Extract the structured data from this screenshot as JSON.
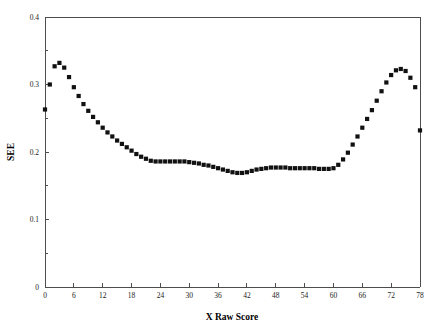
{
  "chart_data": {
    "type": "scatter",
    "title": "",
    "xlabel": "X Raw Score",
    "ylabel": "SEE",
    "xlim": [
      0,
      78
    ],
    "ylim": [
      0,
      0.4
    ],
    "xticks": [
      0,
      6,
      12,
      18,
      24,
      30,
      36,
      42,
      48,
      54,
      60,
      66,
      72,
      78
    ],
    "yticks": [
      0,
      0.1,
      0.2,
      0.3,
      0.4
    ],
    "xtick_labels": [
      "0",
      "6",
      "12",
      "18",
      "24",
      "30",
      "36",
      "42",
      "48",
      "54",
      "60",
      "66",
      "72",
      "78"
    ],
    "ytick_labels": [
      "0",
      "0.1",
      "0.2",
      "0.3",
      "0.4"
    ],
    "grid": false,
    "legend": null,
    "marker": "square",
    "marker_color": "#111111",
    "marker_size": 2.1,
    "x": [
      0,
      1,
      2,
      3,
      4,
      5,
      6,
      7,
      8,
      9,
      10,
      11,
      12,
      13,
      14,
      15,
      16,
      17,
      18,
      19,
      20,
      21,
      22,
      23,
      24,
      25,
      26,
      27,
      28,
      29,
      30,
      31,
      32,
      33,
      34,
      35,
      36,
      37,
      38,
      39,
      40,
      41,
      42,
      43,
      44,
      45,
      46,
      47,
      48,
      49,
      50,
      51,
      52,
      53,
      54,
      55,
      56,
      57,
      58,
      59,
      60,
      61,
      62,
      63,
      64,
      65,
      66,
      67,
      68,
      69,
      70,
      71,
      72,
      73,
      74,
      75,
      76,
      77,
      78
    ],
    "values": [
      0.263,
      0.3,
      0.327,
      0.332,
      0.325,
      0.311,
      0.296,
      0.283,
      0.271,
      0.261,
      0.252,
      0.244,
      0.236,
      0.229,
      0.223,
      0.217,
      0.212,
      0.207,
      0.202,
      0.197,
      0.193,
      0.19,
      0.187,
      0.186,
      0.186,
      0.186,
      0.186,
      0.186,
      0.186,
      0.186,
      0.185,
      0.184,
      0.183,
      0.181,
      0.18,
      0.178,
      0.176,
      0.174,
      0.172,
      0.17,
      0.169,
      0.169,
      0.17,
      0.172,
      0.174,
      0.175,
      0.176,
      0.177,
      0.177,
      0.177,
      0.177,
      0.176,
      0.176,
      0.176,
      0.176,
      0.176,
      0.176,
      0.175,
      0.175,
      0.175,
      0.176,
      0.181,
      0.189,
      0.199,
      0.211,
      0.223,
      0.236,
      0.249,
      0.262,
      0.276,
      0.29,
      0.303,
      0.314,
      0.321,
      0.323,
      0.32,
      0.31,
      0.296,
      0.232
    ],
    "axes": {
      "left_spine": true,
      "right_spine": true,
      "top_spine": true,
      "bottom_spine": true
    }
  }
}
